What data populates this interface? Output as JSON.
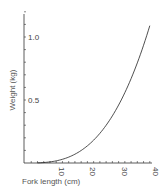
{
  "chart_data": {
    "type": "line",
    "title": "",
    "xlabel": "Fork length (cm)",
    "ylabel": "Weight (kg)",
    "xlim": [
      0,
      40
    ],
    "ylim": [
      0,
      1.2
    ],
    "x_ticks": [
      10,
      20,
      30,
      40
    ],
    "x_tick_labels": [
      "10",
      "20",
      "30",
      "40"
    ],
    "y_ticks": [
      0.5,
      1.0
    ],
    "y_tick_labels": [
      "0.5",
      "1.0"
    ],
    "grid": false,
    "legend": null,
    "series": [
      {
        "name": "Length-weight relationship",
        "x": [
          5,
          10,
          15,
          20,
          25,
          30,
          35,
          40
        ],
        "values": [
          0.002,
          0.017,
          0.058,
          0.138,
          0.27,
          0.46,
          0.73,
          1.09
        ]
      }
    ]
  }
}
